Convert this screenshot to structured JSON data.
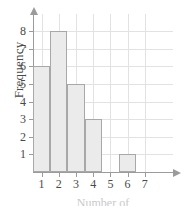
{
  "chart_data": {
    "type": "bar",
    "title": "",
    "subtitle": "",
    "xlabel": "Number of",
    "ylabel": "Frequency",
    "categories": [
      "1",
      "2",
      "3",
      "4",
      "5",
      "6",
      "7"
    ],
    "values": [
      6,
      8,
      5,
      3,
      0,
      1,
      0
    ],
    "series": [
      {
        "name": "Frequency",
        "values": [
          6,
          8,
          5,
          3,
          0,
          1,
          0
        ]
      }
    ],
    "xlim": [
      0.5,
      7.5
    ],
    "ylim": [
      0,
      8
    ],
    "x_ticks": [
      "1",
      "2",
      "3",
      "4",
      "5",
      "6",
      "7"
    ],
    "y_ticks": [
      "1",
      "2",
      "3",
      "4",
      "5",
      "6",
      "7",
      "8"
    ],
    "grid": true,
    "legend": false,
    "legend_position": "none",
    "bar_fill_color": "#ebebeb",
    "bar_border_color": "#a8a8a8",
    "axis_color": "#9b9b9b",
    "grid_color": "#e2e2e2",
    "text_color": "#4a4a4a",
    "background_color": "#ffffff"
  }
}
